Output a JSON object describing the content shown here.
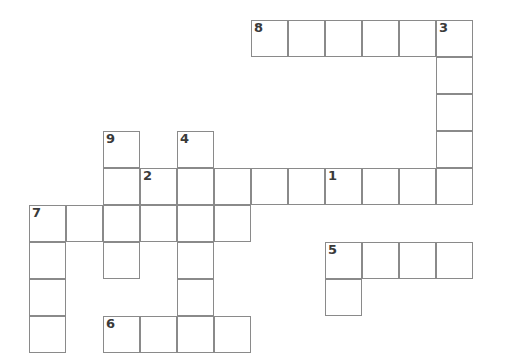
{
  "puzzle": {
    "kind": "crossword-grid",
    "title": "Crossword Puzzle Grid",
    "background_color": "#ffffff",
    "cell_border_color": "#8a8a8a",
    "number_color": "#3a3a3a",
    "cell_size": 37,
    "origin": {
      "x": 29,
      "y": 20
    },
    "columns": 12,
    "rows": 9,
    "clue_numbers": [
      "1",
      "2",
      "3",
      "4",
      "5",
      "6",
      "7",
      "8",
      "9"
    ],
    "entries": [
      {
        "number": "8",
        "direction": "across",
        "start_col": 6,
        "start_row": 0,
        "length": 6
      },
      {
        "number": "3",
        "direction": "down",
        "start_col": 11,
        "start_row": 0,
        "length": 5
      },
      {
        "number": "9",
        "direction": "down",
        "start_col": 2,
        "start_row": 3,
        "length": 4
      },
      {
        "number": "4",
        "direction": "down",
        "start_col": 4,
        "start_row": 3,
        "length": 6
      },
      {
        "number": "2",
        "direction": "across",
        "start_col": 3,
        "start_row": 4,
        "length": 9
      },
      {
        "number": "1",
        "direction": "down",
        "start_col": 8,
        "start_row": 4,
        "length": 4
      },
      {
        "number": "7",
        "direction": "across",
        "start_col": 0,
        "start_row": 5,
        "length": 6
      },
      {
        "number": "7",
        "direction": "down",
        "start_col": 0,
        "start_row": 5,
        "length": 4
      },
      {
        "number": "5",
        "direction": "across",
        "start_col": 8,
        "start_row": 6,
        "length": 4
      },
      {
        "number": "6",
        "direction": "across",
        "start_col": 2,
        "start_row": 8,
        "length": 4
      }
    ],
    "cells": [
      {
        "col": 6,
        "row": 0,
        "number": "8"
      },
      {
        "col": 7,
        "row": 0,
        "number": ""
      },
      {
        "col": 8,
        "row": 0,
        "number": ""
      },
      {
        "col": 9,
        "row": 0,
        "number": ""
      },
      {
        "col": 10,
        "row": 0,
        "number": ""
      },
      {
        "col": 11,
        "row": 0,
        "number": "3"
      },
      {
        "col": 11,
        "row": 1,
        "number": ""
      },
      {
        "col": 11,
        "row": 2,
        "number": ""
      },
      {
        "col": 2,
        "row": 3,
        "number": "9"
      },
      {
        "col": 4,
        "row": 3,
        "number": "4"
      },
      {
        "col": 11,
        "row": 3,
        "number": ""
      },
      {
        "col": 3,
        "row": 4,
        "number": "2"
      },
      {
        "col": 4,
        "row": 4,
        "number": ""
      },
      {
        "col": 5,
        "row": 4,
        "number": ""
      },
      {
        "col": 6,
        "row": 4,
        "number": ""
      },
      {
        "col": 7,
        "row": 4,
        "number": ""
      },
      {
        "col": 8,
        "row": 4,
        "number": "1"
      },
      {
        "col": 9,
        "row": 4,
        "number": ""
      },
      {
        "col": 10,
        "row": 4,
        "number": ""
      },
      {
        "col": 11,
        "row": 4,
        "number": ""
      },
      {
        "col": 2,
        "row": 4,
        "number": ""
      },
      {
        "col": 0,
        "row": 5,
        "number": "7"
      },
      {
        "col": 1,
        "row": 5,
        "number": ""
      },
      {
        "col": 2,
        "row": 5,
        "number": ""
      },
      {
        "col": 3,
        "row": 5,
        "number": ""
      },
      {
        "col": 4,
        "row": 5,
        "number": ""
      },
      {
        "col": 5,
        "row": 5,
        "number": ""
      },
      {
        "col": 0,
        "row": 6,
        "number": ""
      },
      {
        "col": 2,
        "row": 6,
        "number": ""
      },
      {
        "col": 4,
        "row": 6,
        "number": ""
      },
      {
        "col": 8,
        "row": 6,
        "number": "5"
      },
      {
        "col": 9,
        "row": 6,
        "number": ""
      },
      {
        "col": 10,
        "row": 6,
        "number": ""
      },
      {
        "col": 11,
        "row": 6,
        "number": ""
      },
      {
        "col": 0,
        "row": 7,
        "number": ""
      },
      {
        "col": 4,
        "row": 7,
        "number": ""
      },
      {
        "col": 8,
        "row": 7,
        "number": ""
      },
      {
        "col": 0,
        "row": 8,
        "number": ""
      },
      {
        "col": 2,
        "row": 8,
        "number": "6"
      },
      {
        "col": 3,
        "row": 8,
        "number": ""
      },
      {
        "col": 4,
        "row": 8,
        "number": ""
      },
      {
        "col": 5,
        "row": 8,
        "number": ""
      }
    ]
  }
}
